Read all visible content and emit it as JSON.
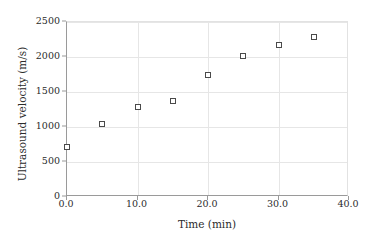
{
  "chart_data": {
    "type": "scatter",
    "title": "",
    "xlabel": "Time (min)",
    "ylabel": "Ultrasound velocity (m/s)",
    "xlim": [
      0,
      40
    ],
    "ylim": [
      0,
      2500
    ],
    "xticks": [
      0,
      10,
      20,
      30,
      40
    ],
    "xtick_labels": [
      "0.0",
      "10.0",
      "20.0",
      "30.0",
      "40.0"
    ],
    "yticks": [
      0,
      500,
      1000,
      1500,
      2000,
      2500
    ],
    "ytick_labels": [
      "0",
      "500",
      "1000",
      "1500",
      "2000",
      "2500"
    ],
    "grid": true,
    "legend": null,
    "marker": "open-square",
    "marker_color": "#4a4a4a",
    "grid_color": "#e6e6e6",
    "axis_color": "#9a9a9a",
    "background_color": "#ffffff",
    "x": [
      0,
      5,
      10,
      15,
      20,
      25,
      30,
      35
    ],
    "values": [
      720,
      1050,
      1280,
      1370,
      1740,
      2020,
      2170,
      2280
    ],
    "points": [
      {
        "x": 0,
        "y": 720
      },
      {
        "x": 5,
        "y": 1050
      },
      {
        "x": 10,
        "y": 1280
      },
      {
        "x": 15,
        "y": 1370
      },
      {
        "x": 20,
        "y": 1740
      },
      {
        "x": 25,
        "y": 2020
      },
      {
        "x": 30,
        "y": 2170
      },
      {
        "x": 35,
        "y": 2280
      }
    ]
  }
}
